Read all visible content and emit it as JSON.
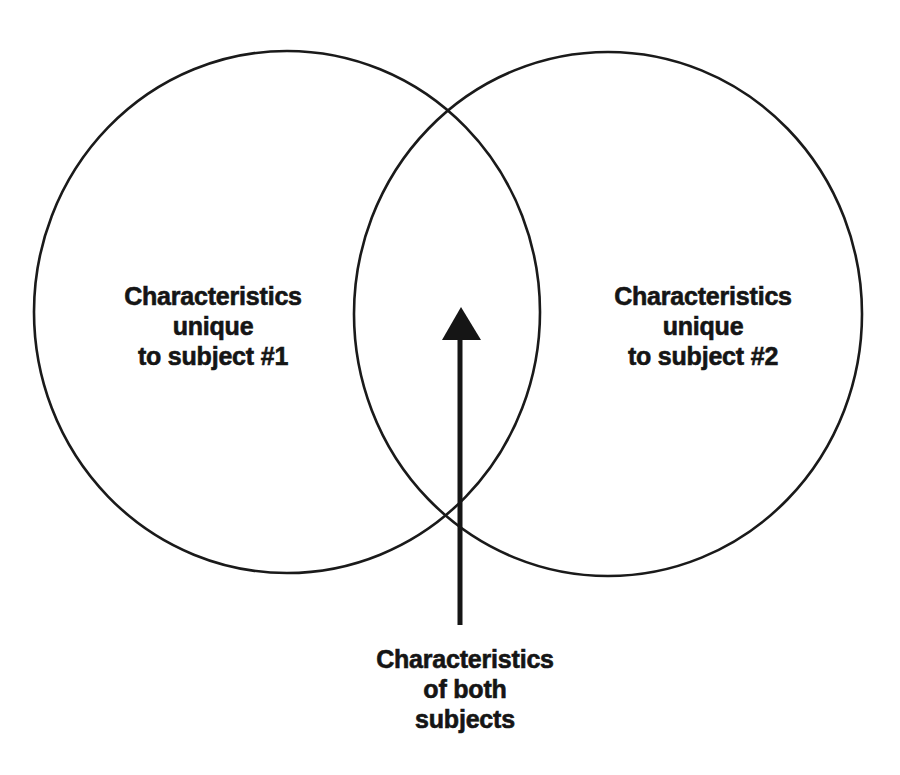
{
  "diagram": {
    "type": "venn",
    "stroke_color": "#1a1a1a",
    "background": "#ffffff",
    "circles": [
      {
        "id": "subject-1",
        "cx": 287,
        "cy": 312,
        "rx": 253,
        "ry": 261,
        "label_lines": [
          "Characteristics",
          "unique",
          "to subject #1"
        ]
      },
      {
        "id": "subject-2",
        "cx": 608,
        "cy": 314,
        "rx": 254,
        "ry": 262,
        "label_lines": [
          "Characteristics",
          "unique",
          "to subject #2"
        ]
      }
    ],
    "overlap": {
      "label_lines": [
        "Characteristics",
        "of both",
        "subjects"
      ],
      "arrow": {
        "x": 460,
        "tail_y": 625,
        "tip_y": 307,
        "head_base_y": 340,
        "head_half_width": 19
      }
    }
  }
}
